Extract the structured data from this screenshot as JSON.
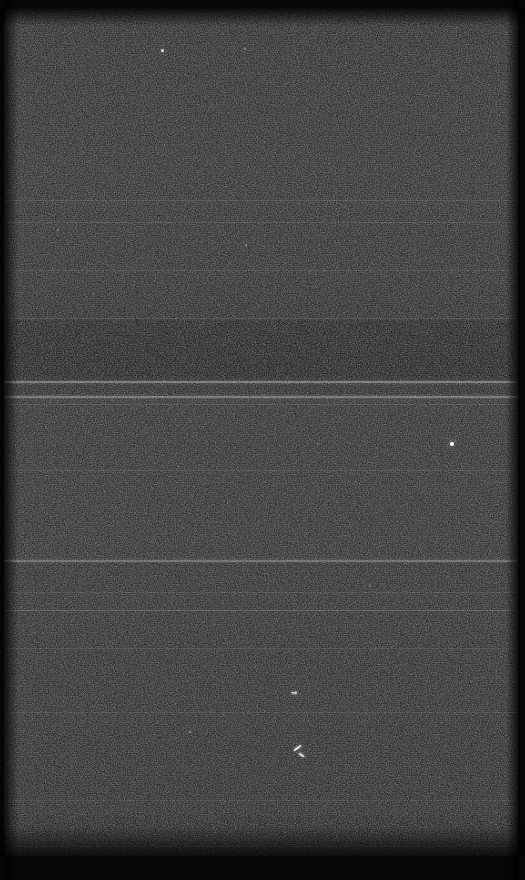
{
  "frame": {
    "width": 525,
    "height": 880,
    "background_color": "#1b1b1b",
    "overscan_color": "#050505",
    "description": "raw-detector-frame"
  },
  "overscan": {
    "top_height": 8,
    "bottom_height": 24,
    "left_width": 4,
    "right_width": 7,
    "soft_top_height": 18,
    "soft_bottom_height": 30,
    "soft_left_width": 14,
    "soft_right_width": 12
  },
  "region_bands": [
    {
      "name": "upper-bright-region",
      "y": 8,
      "height": 312,
      "color": "rgba(255,255,255,0.012)"
    },
    {
      "name": "mid-dark-region",
      "y": 320,
      "height": 62,
      "color": "rgba(0,0,0,0.16)"
    },
    {
      "name": "lower-bright-region",
      "y": 400,
      "height": 160,
      "color": "rgba(255,255,255,0.015)"
    },
    {
      "name": "lower-mid-region",
      "y": 566,
      "height": 250,
      "color": "rgba(255,255,255,0.010)"
    },
    {
      "name": "bottom-dim-region",
      "y": 816,
      "height": 40,
      "color": "rgba(0,0,0,0.10)"
    }
  ],
  "horizontal_lines": [
    {
      "name": "readout-line-1",
      "y": 200,
      "height": 1,
      "opacity": 0.1
    },
    {
      "name": "readout-line-2",
      "y": 222,
      "height": 1,
      "opacity": 0.09
    },
    {
      "name": "readout-line-3",
      "y": 270,
      "height": 1,
      "opacity": 0.07
    },
    {
      "name": "readout-line-4",
      "y": 318,
      "height": 1,
      "opacity": 0.08
    },
    {
      "name": "bright-readout-line-a",
      "y": 381,
      "height": 2,
      "opacity": 0.34
    },
    {
      "name": "bright-readout-line-b",
      "y": 396,
      "height": 2,
      "opacity": 0.3
    },
    {
      "name": "readout-line-5",
      "y": 404,
      "height": 1,
      "opacity": 0.1
    },
    {
      "name": "readout-line-6",
      "y": 470,
      "height": 1,
      "opacity": 0.07
    },
    {
      "name": "bright-readout-line-c",
      "y": 560,
      "height": 2,
      "opacity": 0.26
    },
    {
      "name": "readout-line-7",
      "y": 592,
      "height": 1,
      "opacity": 0.08
    },
    {
      "name": "faint-readout-line-d",
      "y": 610,
      "height": 1,
      "opacity": 0.16
    },
    {
      "name": "readout-line-8",
      "y": 648,
      "height": 1,
      "opacity": 0.07
    },
    {
      "name": "readout-line-9",
      "y": 712,
      "height": 1,
      "opacity": 0.07
    },
    {
      "name": "readout-line-10",
      "y": 800,
      "height": 1,
      "opacity": 0.06
    },
    {
      "name": "readout-line-11",
      "y": 846,
      "height": 1,
      "opacity": 0.07
    }
  ],
  "point_sources": [
    {
      "name": "star-1",
      "x": 162,
      "y": 50,
      "size": 3,
      "brightness": 0.85
    },
    {
      "name": "star-2",
      "x": 245,
      "y": 49,
      "size": 2,
      "brightness": 0.45
    },
    {
      "name": "star-3",
      "x": 452,
      "y": 444,
      "size": 4,
      "brightness": 1.0
    },
    {
      "name": "star-4",
      "x": 296,
      "y": 692,
      "size": 2,
      "brightness": 0.55
    },
    {
      "name": "star-5",
      "x": 190,
      "y": 732,
      "size": 2,
      "brightness": 0.4
    },
    {
      "name": "star-6",
      "x": 246,
      "y": 245,
      "size": 2,
      "brightness": 0.35
    },
    {
      "name": "star-7",
      "x": 58,
      "y": 230,
      "size": 2,
      "brightness": 0.3
    },
    {
      "name": "star-8",
      "x": 186,
      "y": 856,
      "size": 2,
      "brightness": 0.35
    },
    {
      "name": "star-9",
      "x": 370,
      "y": 586,
      "size": 2,
      "brightness": 0.3
    },
    {
      "name": "star-10",
      "x": 318,
      "y": 444,
      "size": 2,
      "brightness": 0.28
    }
  ],
  "cosmic_rays": [
    {
      "name": "cosmic-ray-track-1",
      "x": 297,
      "y": 748,
      "length": 9,
      "thickness": 2,
      "angle": -38,
      "brightness": 0.95
    },
    {
      "name": "cosmic-ray-track-2",
      "x": 301,
      "y": 755,
      "length": 7,
      "thickness": 2,
      "angle": 35,
      "brightness": 0.8
    },
    {
      "name": "cosmic-ray-track-3",
      "x": 294,
      "y": 693,
      "length": 6,
      "thickness": 2,
      "angle": 12,
      "brightness": 0.7
    }
  ]
}
